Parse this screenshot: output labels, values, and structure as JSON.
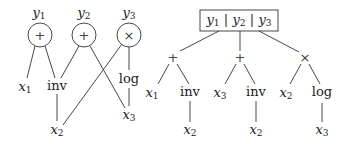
{
  "left_graph": {
    "outputs": [
      {
        "id": "y1",
        "label": "y",
        "sub": "1",
        "op": "+"
      },
      {
        "id": "y2",
        "label": "y",
        "sub": "2",
        "op": "+"
      },
      {
        "id": "y3",
        "label": "y",
        "sub": "3",
        "op": "×"
      }
    ],
    "nodes": {
      "x1": {
        "label": "x",
        "sub": "1"
      },
      "inv": {
        "label": "inv"
      },
      "log": {
        "label": "log"
      },
      "x3": {
        "label": "x",
        "sub": "3"
      },
      "x2": {
        "label": "x",
        "sub": "2"
      }
    },
    "edges": [
      [
        "y1",
        "x1"
      ],
      [
        "y1",
        "inv"
      ],
      [
        "y2",
        "inv"
      ],
      [
        "y2",
        "x3"
      ],
      [
        "y3",
        "x2"
      ],
      [
        "y3",
        "log"
      ],
      [
        "log",
        "x3"
      ],
      [
        "inv",
        "x2"
      ]
    ]
  },
  "right_tree": {
    "root_box": [
      {
        "label": "y",
        "sub": "1"
      },
      {
        "label": "y",
        "sub": "2"
      },
      {
        "label": "y",
        "sub": "3"
      }
    ],
    "separator": "|",
    "subtrees": [
      {
        "op": "+",
        "left": {
          "label": "x",
          "sub": "1"
        },
        "right": {
          "label": "inv",
          "child": {
            "label": "x",
            "sub": "2"
          }
        }
      },
      {
        "op": "+",
        "left": {
          "label": "x",
          "sub": "3"
        },
        "right": {
          "label": "inv",
          "child": {
            "label": "x",
            "sub": "2"
          }
        }
      },
      {
        "op": "×",
        "left": {
          "label": "x",
          "sub": "2"
        },
        "right": {
          "label": "log",
          "child": {
            "label": "x",
            "sub": "3"
          }
        }
      }
    ]
  }
}
